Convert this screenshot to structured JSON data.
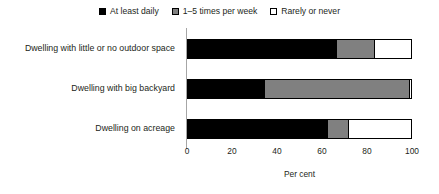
{
  "chart_data": {
    "type": "bar",
    "orientation": "horizontal",
    "stacked": true,
    "title": "",
    "xlabel": "Per cent",
    "ylabel": "",
    "xlim": [
      0,
      100
    ],
    "xticks": [
      0,
      20,
      40,
      60,
      80,
      100
    ],
    "xtick_labels": [
      "0",
      "20",
      "40",
      "60",
      "80",
      "100"
    ],
    "grid": false,
    "legend_position": "top-center",
    "categories": [
      "Dwelling with little or no outdoor space",
      "Dwelling with big backyard",
      "Dwelling on acreage"
    ],
    "series": [
      {
        "name": "At least daily",
        "color": "#000000",
        "values": [
          66,
          34,
          62
        ]
      },
      {
        "name": "1–5 times per week",
        "color": "#808080",
        "values": [
          17,
          64.5,
          9.5
        ]
      },
      {
        "name": "Rarely or never",
        "color": "#ffffff",
        "values": [
          17,
          1.5,
          28.5
        ]
      }
    ]
  },
  "legend": {
    "items": [
      {
        "label": "At least daily",
        "swatch": "black-swatch-icon"
      },
      {
        "label": "1–5 times per week",
        "swatch": "gray-swatch-icon"
      },
      {
        "label": "Rarely or never",
        "swatch": "white-swatch-icon"
      }
    ]
  },
  "axis": {
    "x_title": "Per cent",
    "tick_labels": [
      "0",
      "20",
      "40",
      "60",
      "80",
      "100"
    ]
  },
  "colors": {
    "series_black": "#000000",
    "series_gray": "#808080",
    "series_white": "#ffffff",
    "axis_line": "#a6a6a6",
    "text": "#231f20",
    "background": "#ffffff"
  }
}
